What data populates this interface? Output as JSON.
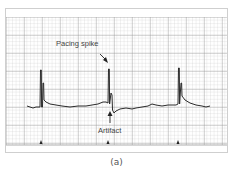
{
  "figure": {
    "caption": "(a)",
    "annotations": {
      "pacing_spike": "Pacing spike",
      "artifact": "Artifact"
    },
    "colors": {
      "grid_minor": "#c8c8c8",
      "grid_major": "#8e8e8e",
      "trace": "#2b2b2b",
      "text": "#444444"
    },
    "spike_x": [
      41,
      109,
      179
    ],
    "marker_x": [
      41,
      108,
      178
    ]
  }
}
